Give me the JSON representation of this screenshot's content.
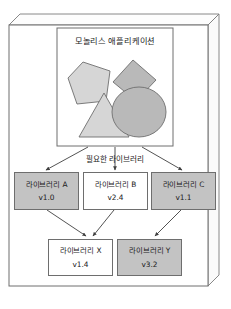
{
  "figure": {
    "type": "diagram",
    "caption": ""
  },
  "container": {
    "name": "outer-3d-panel",
    "style": "isometric-box",
    "fill": "#ffffff",
    "stroke": "#6e6e6e"
  },
  "monolith": {
    "title": "모놀리스 애플리케이션",
    "panel_fill": "#ffffff",
    "panel_stroke": "#6e6e6e",
    "shapes": [
      {
        "name": "pentagon",
        "fill": "#d6d6d6",
        "stroke": "#6e6e6e"
      },
      {
        "name": "diamond",
        "fill": "#b9b9b9",
        "stroke": "#6e6e6e"
      },
      {
        "name": "triangle",
        "fill": "#d6d6d6",
        "stroke": "#6e6e6e"
      },
      {
        "name": "circle",
        "fill": "#b9b9b9",
        "stroke": "#6e6e6e"
      }
    ]
  },
  "required_libraries_label": "필요한 라이브러리",
  "library_tier_1": [
    {
      "name": "라이브러리 A",
      "version": "v1.0",
      "fill": "#c3c3c3"
    },
    {
      "name": "라이브러리 B",
      "version": "v2.4",
      "fill": "#ffffff"
    },
    {
      "name": "라이브러리 C",
      "version": "v1.1",
      "fill": "#c3c3c3"
    }
  ],
  "library_tier_2": [
    {
      "name": "라이브러리 X",
      "version": "v1.4",
      "fill": "#ffffff"
    },
    {
      "name": "라이브러리 Y",
      "version": "v3.2",
      "fill": "#c3c3c3"
    }
  ],
  "arrows": {
    "stroke": "#4a4a4a",
    "from_monolith_to": [
      "라이브러리 A",
      "라이브러리 B",
      "라이브러리 C"
    ],
    "from_tier1_to_tier2": [
      {
        "from": "라이브러리 A",
        "to": "라이브러리 X"
      },
      {
        "from": "라이브러리 B",
        "to": "라이브러리 X"
      },
      {
        "from": "라이브러리 C",
        "to": "라이브러리 Y"
      }
    ]
  },
  "colors": {
    "gray_fill": "#c3c3c3",
    "shape_light": "#d6d6d6",
    "shape_dark": "#b9b9b9",
    "line": "#6e6e6e",
    "text": "#1b1b1b"
  }
}
